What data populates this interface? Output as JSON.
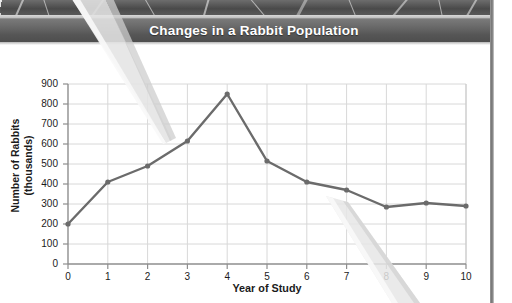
{
  "figure": {
    "title": "Changes in a Rabbit Population",
    "photo_caption": "grass-photo-strip"
  },
  "chart_data": {
    "type": "line",
    "title": "Changes in a Rabbit Population",
    "xlabel": "Year of Study",
    "ylabel": "Number of Rabbits (thousands)",
    "ylabel_line1": "Number of Rabbits",
    "ylabel_line2": "(thousands)",
    "x": [
      0,
      1,
      2,
      3,
      4,
      5,
      6,
      7,
      8,
      9,
      10
    ],
    "values": [
      200,
      410,
      490,
      615,
      850,
      515,
      410,
      370,
      285,
      305,
      290
    ],
    "xlim": [
      0,
      10
    ],
    "ylim": [
      0,
      900
    ],
    "xticks": [
      "0",
      "1",
      "2",
      "3",
      "4",
      "5",
      "6",
      "7",
      "8",
      "9",
      "10"
    ],
    "yticks": [
      "0",
      "100",
      "200",
      "300",
      "400",
      "500",
      "600",
      "700",
      "800",
      "900"
    ],
    "grid": true,
    "legend": null,
    "series_color": "#6b6b6b",
    "marker": "circle"
  },
  "annotations": {
    "pointer_1": "pointer-tip-year-3",
    "pointer_2": "pointer-tip-year-7"
  },
  "colors": {
    "title_bar_start": "#7c7c7c",
    "title_bar_end": "#4e4e4e",
    "title_text": "#ffffff",
    "line": "#6b6b6b",
    "grid": "#d6d6d6",
    "axis": "#9a9a9a",
    "text": "#1b1b1b"
  }
}
